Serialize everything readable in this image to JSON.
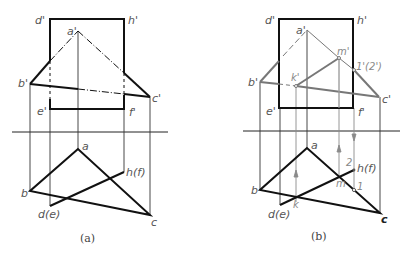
{
  "figure": {
    "panels": [
      {
        "caption": "(a)",
        "labels": {
          "d_prime": "d'",
          "h_prime": "h'",
          "a_prime": "a'",
          "b_prime": "b'",
          "c_prime": "c'",
          "e_prime": "e'",
          "f_prime": "f'",
          "a": "a",
          "b": "b",
          "c": "c",
          "d_e": "d(e)",
          "h_f": "h(f)"
        }
      },
      {
        "caption": "(b)",
        "labels": {
          "d_prime": "d'",
          "h_prime": "h'",
          "a_prime": "a'",
          "b_prime": "b'",
          "c_prime": "c'",
          "e_prime": "e'",
          "f_prime": "f'",
          "k_prime": "k'",
          "m_prime": "m'",
          "p12_prime": "1'(2')",
          "a": "a",
          "b": "b",
          "c": "c",
          "d_e": "d(e)",
          "h_f": "h(f)",
          "k": "k",
          "m": "m",
          "p1": "1",
          "p2": "2"
        }
      }
    ],
    "colors": {
      "visible_line": "#111111",
      "thin_line": "#333333",
      "construction_line": "#8a8a8a",
      "highlight_line": "#777777",
      "label": "#555555"
    }
  }
}
